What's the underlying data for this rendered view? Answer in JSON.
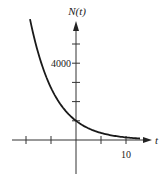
{
  "chart_data": {
    "type": "line",
    "title": "",
    "xlabel": "t",
    "ylabel": "N(t)",
    "xlim": [
      -15,
      13
    ],
    "ylim": [
      -1500,
      7000
    ],
    "x_ticks": [
      -10,
      -5,
      0,
      5,
      10
    ],
    "x_tick_labels": [
      {
        "value": 10,
        "text": "10"
      }
    ],
    "y_ticks": [
      1000,
      2000,
      3000,
      4000,
      5000
    ],
    "y_tick_labels": [
      {
        "value": 4000,
        "text": "4000"
      }
    ],
    "grid": false,
    "legend": null,
    "series": [
      {
        "name": "N(t) = 1000 e^{-0.2t}",
        "x": [
          -9.2,
          -8,
          -6,
          -4,
          -2,
          0,
          2,
          4,
          6,
          8,
          10,
          12.8
        ],
        "y": [
          6300,
          4953,
          3320,
          2226,
          1492,
          1000,
          670,
          449,
          301,
          202,
          135,
          77
        ]
      }
    ],
    "annotations": [
      "N(0) ≈ 1000 (y-intercept)"
    ]
  },
  "labels": {
    "y_axis": "N(t)",
    "x_axis": "t",
    "y_tick": "4000",
    "x_tick": "10"
  }
}
